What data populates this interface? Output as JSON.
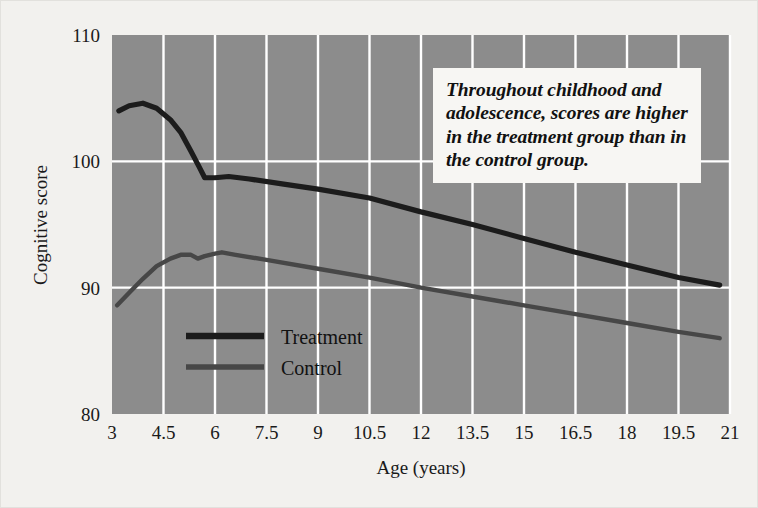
{
  "figure": {
    "background_color": "#f2f1ee",
    "plot_background_color": "#8c8c8c",
    "gridline_color": "#ffffff"
  },
  "annotation": {
    "text": "Throughout childhood and adolescence, scores are higher in the treatment group than in the control group."
  },
  "legend": {
    "items": [
      {
        "label": "Treatment",
        "color": "#1c1c1c"
      },
      {
        "label": "Control",
        "color": "#474747"
      }
    ]
  },
  "chart_data": {
    "type": "line",
    "title": "",
    "xlabel": "Age (years)",
    "ylabel": "Cognitive score",
    "xlim": [
      3,
      21
    ],
    "ylim": [
      80,
      110
    ],
    "xticks": [
      "3",
      "4.5",
      "6",
      "7.5",
      "9",
      "10.5",
      "12",
      "13.5",
      "15",
      "16.5",
      "18",
      "19.5",
      "21"
    ],
    "xtick_values": [
      3,
      4.5,
      6,
      7.5,
      9,
      10.5,
      12,
      13.5,
      15,
      16.5,
      18,
      19.5,
      21
    ],
    "yticks": [
      "80",
      "90",
      "100",
      "110"
    ],
    "ytick_values": [
      80,
      90,
      100,
      110
    ],
    "grid": true,
    "legend_position": "inside-lower-left",
    "series": [
      {
        "name": "Treatment",
        "color": "#1c1c1c",
        "width": 5.2,
        "x": [
          3.2,
          3.5,
          3.9,
          4.3,
          4.7,
          5.0,
          5.3,
          5.55,
          5.7,
          6.0,
          6.4,
          7.0,
          8.0,
          9.0,
          10.5,
          12.0,
          13.5,
          15.0,
          16.5,
          18.0,
          19.5,
          20.7
        ],
        "y": [
          104.0,
          104.4,
          104.6,
          104.2,
          103.3,
          102.3,
          100.8,
          99.5,
          98.7,
          98.7,
          98.8,
          98.6,
          98.2,
          97.8,
          97.1,
          96.0,
          95.0,
          93.9,
          92.8,
          91.8,
          90.8,
          90.2
        ]
      },
      {
        "name": "Control",
        "color": "#474747",
        "width": 4.4,
        "x": [
          3.15,
          3.5,
          3.9,
          4.3,
          4.7,
          5.0,
          5.3,
          5.5,
          5.7,
          6.0,
          6.2,
          6.6,
          7.5,
          9.0,
          10.5,
          12.0,
          13.5,
          15.0,
          16.5,
          18.0,
          19.5,
          20.7
        ],
        "y": [
          88.6,
          89.6,
          90.7,
          91.7,
          92.3,
          92.6,
          92.6,
          92.3,
          92.5,
          92.7,
          92.8,
          92.6,
          92.2,
          91.5,
          90.8,
          90.0,
          89.3,
          88.6,
          87.9,
          87.2,
          86.5,
          86.0
        ]
      }
    ]
  }
}
